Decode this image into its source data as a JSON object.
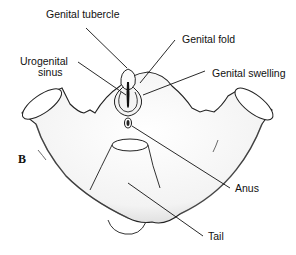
{
  "figure": {
    "panel_letter": "B",
    "labels": {
      "genital_tubercle": "Genital tubercle",
      "genital_fold": "Genital fold",
      "urogenital_sinus_line1": "Urogenital",
      "urogenital_sinus_line2": "sinus",
      "genital_swelling": "Genital swelling",
      "anus": "Anus",
      "tail": "Tail"
    }
  }
}
